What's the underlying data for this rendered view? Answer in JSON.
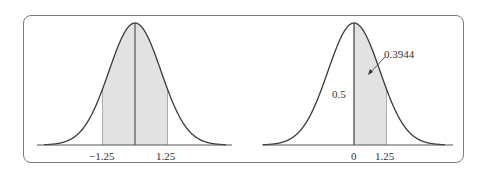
{
  "figure": {
    "left_panel": {
      "shaded_from": -1.25,
      "shaded_to": 1.25,
      "tick_labels": [
        "−1.25",
        "1.25"
      ]
    },
    "right_panel": {
      "shaded_from": 0,
      "shaded_to": 1.25,
      "tick_labels": [
        "0",
        "1.25"
      ],
      "annotations": {
        "left_half_area": "0.5",
        "shaded_area": "0.3944"
      }
    },
    "colors": {
      "curve": "#3a3a3a",
      "shade": "#e2e2e2",
      "frame": "#7a7a7a"
    }
  }
}
